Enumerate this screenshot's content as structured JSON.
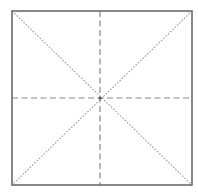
{
  "figure": {
    "canvas": {
      "width": 198,
      "height": 193,
      "background": "#ffffff"
    },
    "square": {
      "name": "square-outline",
      "left": 12,
      "top": 11,
      "right": 192,
      "bottom": 185,
      "width": 180,
      "height": 174,
      "stroke_color": "#6b6b6b",
      "stroke_width": 1.6,
      "fill": "none",
      "style": "solid"
    },
    "center_point": {
      "name": "center-point",
      "x": 100,
      "y": 98,
      "color": "#5a5a5a",
      "radius": 1.6
    },
    "corners": [
      {
        "name": "corner-top-left",
        "x": 12,
        "y": 11
      },
      {
        "name": "corner-top-right",
        "x": 192,
        "y": 11
      },
      {
        "name": "corner-bottom-right",
        "x": 192,
        "y": 185
      },
      {
        "name": "corner-bottom-left",
        "x": 12,
        "y": 185
      }
    ],
    "lines": [
      {
        "name": "diagonal-top-left-to-bottom-right",
        "kind": "diagonal",
        "x1": 12,
        "y1": 11,
        "x2": 192,
        "y2": 185,
        "stroke_color": "#9b9b9b",
        "stroke_width": 1.1,
        "dash_pattern": "1.6 1.6",
        "style": "dotted-dash"
      },
      {
        "name": "diagonal-top-right-to-bottom-left",
        "kind": "diagonal",
        "x1": 192,
        "y1": 11,
        "x2": 12,
        "y2": 185,
        "stroke_color": "#9b9b9b",
        "stroke_width": 1.1,
        "dash_pattern": "1.6 1.6",
        "style": "dotted-dash"
      },
      {
        "name": "vertical-center-line",
        "kind": "axis",
        "x1": 100,
        "y1": 11,
        "x2": 100,
        "y2": 185,
        "stroke_color": "#8a8a8a",
        "stroke_width": 1.2,
        "dash_pattern": "6 3.5",
        "style": "dashed"
      },
      {
        "name": "horizontal-center-line",
        "kind": "axis",
        "x1": 12,
        "y1": 98,
        "x2": 192,
        "y2": 98,
        "stroke_color": "#8a8a8a",
        "stroke_width": 1.2,
        "dash_pattern": "6 3.5",
        "style": "dashed"
      }
    ],
    "labels": []
  }
}
